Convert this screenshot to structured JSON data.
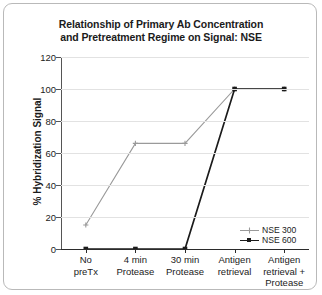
{
  "figure": {
    "title_line1": "Relationship of Primary Ab Concentration",
    "title_line2": "and Pretreatment Regime on Signal: NSE"
  },
  "chart_data": {
    "type": "line",
    "title": "Relationship of Primary Ab Concentration and Pretreatment Regime on Signal: NSE",
    "xlabel": "",
    "ylabel": "% Hybridization Signal",
    "ylim": [
      0,
      120
    ],
    "ytick_values": [
      0,
      20,
      40,
      60,
      80,
      100,
      120
    ],
    "ytick_labels": [
      "0",
      "20",
      "40",
      "60",
      "80",
      "100",
      "120"
    ],
    "categories": [
      "No preTx",
      "4 min Protease",
      "30 min Protease",
      "Antigen retrieval",
      "Antigen retrieval + Protease"
    ],
    "category_lines": [
      [
        "No",
        "preTx"
      ],
      [
        "4 min",
        "Protease"
      ],
      [
        "30 min",
        "Protease"
      ],
      [
        "Antigen",
        "retrieval"
      ],
      [
        "Antigen",
        "retrieval +",
        "Protease"
      ]
    ],
    "series": [
      {
        "name": "NSE 300",
        "values": [
          15,
          66,
          66,
          100,
          100
        ],
        "color": "#9a9a9a",
        "marker": "plus"
      },
      {
        "name": "NSE 600",
        "values": [
          0,
          0,
          0,
          100,
          100
        ],
        "color": "#1b1b1b",
        "marker": "square"
      }
    ],
    "grid": true,
    "grid_color": "#e2e2e2",
    "legend_position": "lower right"
  }
}
